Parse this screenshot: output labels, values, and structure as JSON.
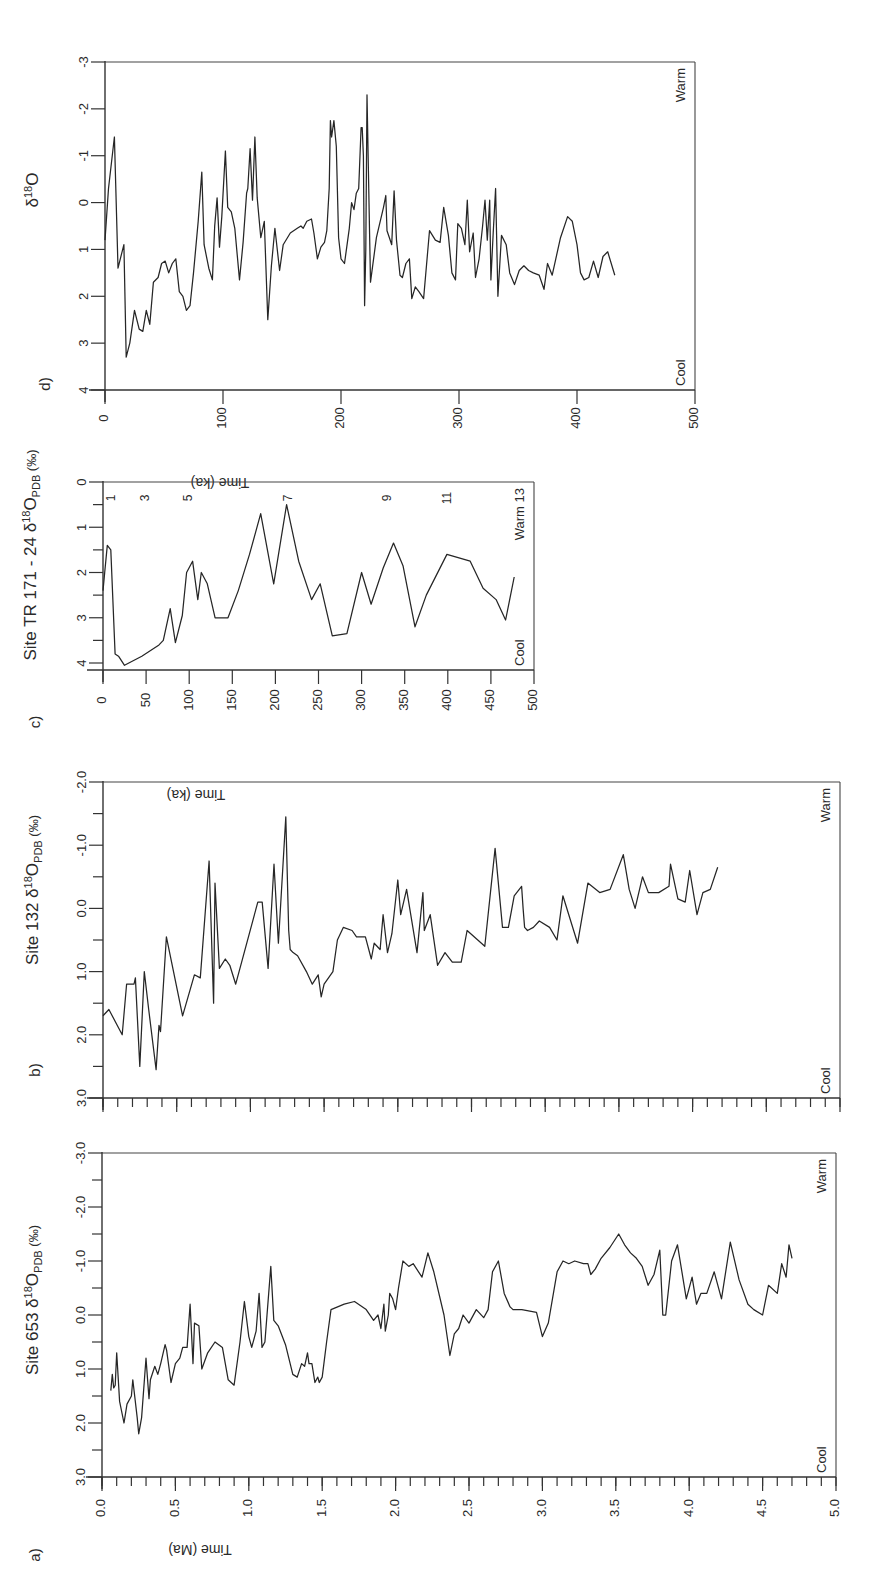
{
  "figure": {
    "panel_labels": [
      "a)",
      "b)",
      "c)",
      "d)"
    ],
    "warm_label": "Warm",
    "cool_label": "Cool",
    "line_color": "#262626"
  },
  "chart_data": [
    {
      "id": "d",
      "type": "line",
      "panel_label": "d)",
      "title": "",
      "ylabel": "δ18O",
      "xlabel": "Time (ka)",
      "xlim": [
        0,
        500
      ],
      "ylim": [
        4,
        -3
      ],
      "y_inverted": true,
      "xticks": [
        0,
        100,
        200,
        300,
        400,
        500
      ],
      "xtick_labels": [
        "0",
        "100",
        "200",
        "300",
        "400",
        "500"
      ],
      "yticks": [
        4,
        3,
        2,
        1,
        0,
        -1,
        -2,
        -3
      ],
      "ytick_labels": [
        "4",
        "3",
        "2",
        "1",
        "0",
        "-1",
        "-2",
        "-3"
      ],
      "annotations": [
        "Warm",
        "Cool"
      ],
      "grid": false,
      "x": [
        0,
        3,
        8,
        11,
        14,
        16,
        18,
        21,
        25,
        29,
        32,
        35,
        38,
        41,
        45,
        48,
        51,
        54,
        57,
        60,
        63,
        66,
        69,
        72,
        75,
        79,
        82,
        84,
        88,
        91,
        93,
        95,
        97,
        99,
        102,
        104,
        107,
        110,
        114,
        117,
        120,
        121,
        123,
        125,
        127,
        129,
        132,
        135,
        138,
        141,
        144,
        148,
        151,
        157,
        163,
        166,
        168,
        171,
        175,
        177,
        180,
        183,
        186,
        188,
        190,
        191,
        192,
        194,
        196,
        198,
        200,
        203,
        207,
        209,
        211,
        213,
        215,
        217,
        218,
        219,
        220,
        221,
        222,
        225,
        230,
        236,
        238,
        239,
        241,
        243,
        245,
        247,
        250,
        252,
        255,
        258,
        260,
        263,
        266,
        270,
        275,
        280,
        284,
        287,
        291,
        294,
        297,
        299,
        302,
        305,
        307,
        309,
        312,
        314,
        317,
        320,
        322,
        324,
        326,
        327,
        329,
        331,
        333,
        336,
        340,
        343,
        347,
        351,
        355,
        359,
        363,
        368,
        372,
        375,
        379,
        382,
        386,
        392,
        396,
        400,
        403,
        406,
        410,
        414,
        418,
        422,
        426,
        432,
        437,
        441,
        447,
        452,
        458,
        462
      ],
      "y": [
        0.8,
        -0.3,
        -1.4,
        1.4,
        1.1,
        0.9,
        3.3,
        3.0,
        2.3,
        2.7,
        2.75,
        2.3,
        2.6,
        1.7,
        1.6,
        1.3,
        1.25,
        1.5,
        1.3,
        1.2,
        1.9,
        2.0,
        2.3,
        2.2,
        1.5,
        0.4,
        -0.65,
        0.9,
        1.4,
        1.65,
        0.5,
        -0.1,
        0.95,
        0.3,
        -1.1,
        0.1,
        0.2,
        0.55,
        1.65,
        0.85,
        -0.2,
        -0.3,
        -1.15,
        -0.05,
        -1.4,
        -0.1,
        0.75,
        0.4,
        2.5,
        1.35,
        0.55,
        1.45,
        0.9,
        0.65,
        0.55,
        0.5,
        0.55,
        0.4,
        0.35,
        0.65,
        1.2,
        0.95,
        0.85,
        0.6,
        -0.3,
        -1.75,
        -1.4,
        -1.75,
        -1.2,
        0.75,
        1.2,
        1.3,
        0.55,
        0.0,
        0.15,
        -0.2,
        -0.3,
        -1.6,
        -1.6,
        -1.0,
        2.2,
        1.0,
        -2.3,
        1.7,
        0.75,
        0.1,
        -0.15,
        0.6,
        0.75,
        0.9,
        -0.25,
        0.8,
        1.55,
        1.6,
        1.3,
        1.2,
        2.05,
        1.8,
        1.9,
        2.05,
        0.6,
        0.8,
        0.85,
        0.1,
        0.7,
        1.5,
        1.65,
        0.45,
        0.55,
        0.9,
        -0.05,
        1.05,
        0.65,
        1.6,
        1.2,
        0.5,
        -0.05,
        0.8,
        -0.05,
        1.65,
        0.65,
        -0.3,
        2.0,
        0.7,
        0.9,
        1.5,
        1.75,
        1.45,
        1.35,
        1.45,
        1.5,
        1.55,
        1.85,
        1.3,
        1.55,
        1.2,
        0.75,
        0.3,
        0.4,
        0.9,
        1.5,
        1.65,
        1.6,
        1.25,
        1.6,
        1.15,
        1.05,
        1.55
      ],
      "series": [
        {
          "name": "δ18O",
          "values_ref": "y"
        }
      ]
    },
    {
      "id": "c",
      "type": "line",
      "panel_label": "c)",
      "title": "",
      "ylabel": "Site TR 171 - 24 δ18O PDB (‰)",
      "xlabel": "Time (ka)",
      "xlim": [
        0,
        500
      ],
      "ylim": [
        4,
        0
      ],
      "y_inverted": true,
      "xticks": [
        0,
        50,
        100,
        150,
        200,
        250,
        300,
        350,
        400,
        450,
        500
      ],
      "xtick_labels": [
        "0",
        "50",
        "100",
        "150",
        "200",
        "250",
        "300",
        "350",
        "400",
        "450",
        "500"
      ],
      "yticks": [
        4,
        3,
        2,
        1,
        0
      ],
      "ytick_labels": [
        "4",
        "3",
        "2",
        "1",
        "0"
      ],
      "stage_labels": [
        {
          "label": "1",
          "x": 10
        },
        {
          "label": "3",
          "x": 50
        },
        {
          "label": "5",
          "x": 100
        },
        {
          "label": "7",
          "x": 215
        },
        {
          "label": "9",
          "x": 330
        },
        {
          "label": "11",
          "x": 400
        },
        {
          "label": "13",
          "x": 480
        }
      ],
      "annotations": [
        "Warm",
        "Cool"
      ],
      "grid": false,
      "x": [
        0,
        2,
        5,
        9,
        14,
        18,
        25,
        45,
        65,
        70,
        78,
        84,
        92,
        97,
        104,
        110,
        114,
        121,
        130,
        145,
        157,
        170,
        183,
        198,
        213,
        227,
        242,
        252,
        266,
        283,
        300,
        311,
        325,
        337,
        348,
        362,
        375,
        399,
        426,
        441,
        456,
        467,
        477
      ],
      "y": [
        2.4,
        2.0,
        1.4,
        1.5,
        3.8,
        3.85,
        4.05,
        3.85,
        3.6,
        3.5,
        2.8,
        3.55,
        2.95,
        2.0,
        1.75,
        2.6,
        2.0,
        2.25,
        3.0,
        3.0,
        2.4,
        1.6,
        0.7,
        2.25,
        0.5,
        1.75,
        2.6,
        2.25,
        3.4,
        3.35,
        2.0,
        2.7,
        1.9,
        1.35,
        1.85,
        3.2,
        2.5,
        1.6,
        1.75,
        2.35,
        2.6,
        3.05,
        2.1
      ],
      "series": [
        {
          "name": "Site TR 171-24 δ18O",
          "values_ref": "y"
        }
      ]
    },
    {
      "id": "b",
      "type": "line",
      "panel_label": "b)",
      "title": "",
      "ylabel": "Site 132 δ18O PDB (‰)",
      "xlabel": "Time (Ma)",
      "xlim": [
        0,
        5.0
      ],
      "ylim": [
        3.0,
        -2.0
      ],
      "y_inverted": true,
      "xticks": [
        0,
        0.5,
        1.0,
        1.5,
        2.0,
        2.5,
        3.0,
        3.5,
        4.0,
        4.5,
        5.0
      ],
      "xtick_labels": [],
      "yticks": [
        3.0,
        2.0,
        1.0,
        0.0,
        -1.0,
        -2.0
      ],
      "ytick_labels": [
        "3.0",
        "2.0",
        "1.0",
        "0.0",
        "-1.0",
        "-2.0"
      ],
      "annotations": [
        "Warm",
        "Cool"
      ],
      "grid": false,
      "x": [
        0.0,
        0.04,
        0.13,
        0.16,
        0.21,
        0.22,
        0.25,
        0.28,
        0.31,
        0.36,
        0.38,
        0.39,
        0.43,
        0.54,
        0.62,
        0.66,
        0.72,
        0.75,
        0.76,
        0.79,
        0.83,
        0.86,
        0.9,
        1.05,
        1.08,
        1.12,
        1.16,
        1.19,
        1.24,
        1.26,
        1.27,
        1.29,
        1.32,
        1.38,
        1.42,
        1.46,
        1.48,
        1.5,
        1.56,
        1.59,
        1.63,
        1.69,
        1.72,
        1.78,
        1.82,
        1.84,
        1.88,
        1.9,
        1.93,
        1.96,
        2.0,
        2.02,
        2.06,
        2.13,
        2.17,
        2.18,
        2.22,
        2.27,
        2.32,
        2.37,
        2.43,
        2.47,
        2.59,
        2.66,
        2.71,
        2.75,
        2.79,
        2.84,
        2.85,
        2.86,
        2.88,
        2.92,
        2.96,
        3.03,
        3.08,
        3.12,
        3.22,
        3.29,
        3.37,
        3.44,
        3.53,
        3.57,
        3.61,
        3.66,
        3.7,
        3.77,
        3.84,
        3.85,
        3.9,
        3.95,
        3.98,
        4.03,
        4.07,
        4.12,
        4.17
      ],
      "y": [
        1.7,
        1.6,
        2.0,
        1.2,
        1.2,
        1.1,
        2.5,
        1.0,
        1.6,
        2.55,
        1.85,
        1.95,
        0.45,
        1.7,
        1.05,
        1.1,
        -0.75,
        1.5,
        -0.4,
        0.95,
        0.8,
        0.9,
        1.2,
        -0.1,
        -0.1,
        0.95,
        -0.7,
        0.55,
        -1.45,
        0.35,
        0.65,
        0.7,
        0.75,
        1.0,
        1.2,
        1.05,
        1.4,
        1.2,
        1.0,
        0.5,
        0.3,
        0.35,
        0.45,
        0.45,
        0.8,
        0.55,
        0.65,
        0.1,
        0.7,
        0.4,
        -0.45,
        0.1,
        -0.3,
        0.7,
        -0.25,
        0.35,
        0.1,
        0.9,
        0.7,
        0.85,
        0.85,
        0.35,
        0.6,
        -0.95,
        0.3,
        0.3,
        -0.2,
        -0.35,
        0.0,
        0.3,
        0.35,
        0.3,
        0.2,
        0.3,
        0.5,
        -0.2,
        0.55,
        -0.4,
        -0.25,
        -0.3,
        -0.85,
        -0.3,
        0.0,
        -0.5,
        -0.25,
        -0.25,
        -0.35,
        -0.7,
        -0.15,
        -0.1,
        -0.6,
        0.1,
        -0.25,
        -0.3,
        -0.65
      ],
      "series": [
        {
          "name": "Site 132 δ18O",
          "values_ref": "y"
        }
      ]
    },
    {
      "id": "a",
      "type": "line",
      "panel_label": "a)",
      "title": "",
      "ylabel": "Site 653 δ18O PDB (‰)",
      "xlabel": "Time (Ma)",
      "xlim": [
        0,
        5.0
      ],
      "ylim": [
        3.0,
        -3.0
      ],
      "y_inverted": true,
      "xticks": [
        0,
        0.5,
        1.0,
        1.5,
        2.0,
        2.5,
        3.0,
        3.5,
        4.0,
        4.5,
        5.0
      ],
      "xtick_labels": [
        "0.0",
        "0.5",
        "1.0",
        "1.5",
        "2.0",
        "2.5",
        "3.0",
        "3.5",
        "4.0",
        "4.5",
        "5.0"
      ],
      "yticks": [
        3.0,
        2.0,
        1.0,
        0.0,
        -1.0,
        -2.0,
        -3.0
      ],
      "ytick_labels": [
        "3.0",
        "2.0",
        "1.0",
        "0.0",
        "-1.0",
        "-2.0",
        "-3.0"
      ],
      "annotations": [
        "Warm",
        "Cool"
      ],
      "grid": false,
      "x": [
        0.06,
        0.07,
        0.08,
        0.09,
        0.1,
        0.12,
        0.15,
        0.17,
        0.2,
        0.21,
        0.24,
        0.25,
        0.27,
        0.3,
        0.32,
        0.33,
        0.36,
        0.38,
        0.4,
        0.43,
        0.44,
        0.47,
        0.5,
        0.53,
        0.55,
        0.58,
        0.6,
        0.62,
        0.63,
        0.66,
        0.68,
        0.72,
        0.77,
        0.82,
        0.86,
        0.9,
        0.94,
        0.97,
        1.0,
        1.02,
        1.05,
        1.07,
        1.09,
        1.11,
        1.15,
        1.17,
        1.2,
        1.25,
        1.3,
        1.33,
        1.36,
        1.38,
        1.4,
        1.41,
        1.43,
        1.45,
        1.47,
        1.48,
        1.5,
        1.53,
        1.56,
        1.65,
        1.72,
        1.8,
        1.85,
        1.88,
        1.9,
        1.92,
        1.93,
        1.95,
        1.96,
        1.98,
        2.0,
        2.02,
        2.05,
        2.09,
        2.12,
        2.18,
        2.22,
        2.26,
        2.33,
        2.37,
        2.4,
        2.43,
        2.46,
        2.5,
        2.55,
        2.6,
        2.63,
        2.66,
        2.7,
        2.74,
        2.78,
        2.8,
        2.86,
        2.96,
        3.0,
        3.04,
        3.1,
        3.14,
        3.18,
        3.22,
        3.28,
        3.31,
        3.33,
        3.36,
        3.4,
        3.46,
        3.52,
        3.56,
        3.6,
        3.64,
        3.68,
        3.72,
        3.76,
        3.8,
        3.82,
        3.84,
        3.88,
        3.92,
        3.98,
        4.02,
        4.05,
        4.08,
        4.12,
        4.17,
        4.22,
        4.28,
        4.34,
        4.4,
        4.44,
        4.5,
        4.54,
        4.6,
        4.63,
        4.66,
        4.68,
        4.7
      ],
      "y": [
        1.4,
        1.1,
        1.35,
        1.3,
        0.7,
        1.6,
        2.0,
        1.65,
        1.5,
        1.2,
        1.9,
        2.2,
        1.9,
        0.8,
        1.55,
        1.2,
        0.95,
        1.1,
        0.9,
        0.55,
        0.65,
        1.25,
        0.9,
        0.8,
        0.6,
        0.6,
        -0.2,
        0.9,
        0.15,
        0.2,
        1.0,
        0.7,
        0.5,
        0.6,
        1.2,
        1.3,
        0.5,
        -0.25,
        0.4,
        0.6,
        0.3,
        -0.4,
        0.6,
        0.5,
        -0.9,
        0.1,
        0.2,
        0.55,
        1.1,
        1.15,
        0.9,
        0.95,
        0.7,
        0.9,
        0.9,
        1.25,
        1.15,
        1.25,
        1.15,
        0.5,
        -0.1,
        -0.2,
        -0.25,
        -0.1,
        0.1,
        0.0,
        0.25,
        -0.2,
        0.3,
        0.0,
        -0.4,
        -0.3,
        -0.1,
        -0.5,
        -1.0,
        -0.9,
        -0.95,
        -0.7,
        -1.15,
        -0.8,
        0.0,
        0.75,
        0.35,
        0.25,
        0.0,
        0.15,
        -0.1,
        0.05,
        -0.1,
        -0.8,
        -1.0,
        -0.4,
        -0.15,
        -0.1,
        -0.1,
        -0.05,
        0.4,
        0.15,
        -0.8,
        -1.0,
        -0.95,
        -1.0,
        -0.95,
        -0.95,
        -0.75,
        -0.85,
        -1.05,
        -1.25,
        -1.5,
        -1.3,
        -1.15,
        -1.05,
        -0.9,
        -0.55,
        -0.75,
        -1.2,
        -0.0,
        0.0,
        -1.0,
        -1.3,
        -0.3,
        -0.7,
        -0.2,
        -0.4,
        -0.4,
        -0.8,
        -0.3,
        -1.35,
        -0.65,
        -0.2,
        -0.1,
        -0.0,
        -0.55,
        -0.4,
        -0.95,
        -0.7,
        -1.3,
        -1.05
      ]
    }
  ]
}
